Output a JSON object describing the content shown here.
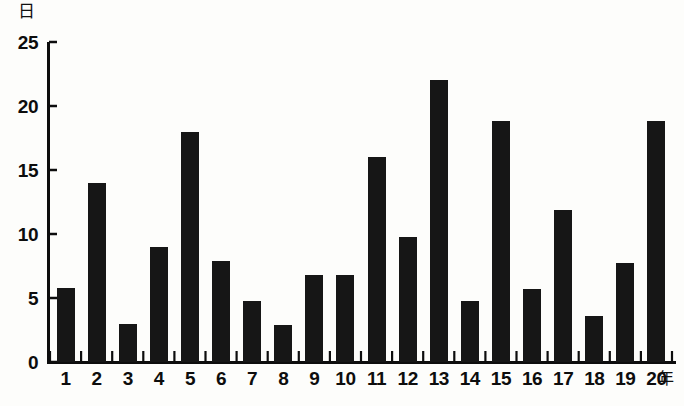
{
  "chart_data": {
    "type": "bar",
    "title": "",
    "xlabel": "年",
    "ylabel": "日",
    "ylim": [
      0,
      25
    ],
    "yticks": [
      0,
      5,
      10,
      15,
      20,
      25
    ],
    "ytick_labels": [
      "0",
      "5",
      "10",
      "15",
      "20",
      "25"
    ],
    "grid": false,
    "legend": "none",
    "categories": [
      "1",
      "2",
      "3",
      "4",
      "5",
      "6",
      "7",
      "8",
      "9",
      "10",
      "11",
      "12",
      "13",
      "14",
      "15",
      "16",
      "17",
      "18",
      "19",
      "20"
    ],
    "values": [
      5.8,
      14.0,
      3.0,
      9.0,
      18.0,
      7.9,
      4.8,
      2.9,
      6.8,
      6.8,
      16.0,
      9.8,
      22.0,
      4.8,
      18.8,
      5.7,
      11.9,
      3.6,
      7.7,
      18.8
    ],
    "bar_color": "#161616",
    "axis_color": "#0d0d0d",
    "background_color": "#fdfdfb"
  },
  "axis": {
    "y_unit": "日",
    "x_unit": "年"
  }
}
